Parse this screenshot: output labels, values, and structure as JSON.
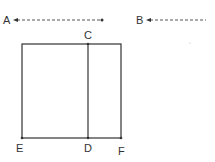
{
  "diagram": {
    "type": "geometry-figure",
    "colors": {
      "stroke": "#333333",
      "dashed": "#555555",
      "background": "#ffffff"
    },
    "arrows": [
      {
        "id": "A",
        "label": "A",
        "style": "dashed",
        "direction": "left",
        "x1": 14,
        "x2": 103,
        "y": 20,
        "label_x": 3,
        "label_y": 24
      },
      {
        "id": "B",
        "label": "B",
        "style": "dashed",
        "direction": "left",
        "x1": 147,
        "x2": 206,
        "y": 20,
        "label_x": 136,
        "label_y": 24
      }
    ],
    "rectangle": {
      "x": 22,
      "y": 44,
      "width": 99,
      "height": 94
    },
    "segment_CD": {
      "x": 88,
      "y1": 44,
      "y2": 138
    },
    "points": [
      {
        "id": "C",
        "label": "C",
        "x": 88,
        "y": 44,
        "label_x": 84,
        "label_y": 39
      },
      {
        "id": "E",
        "label": "E",
        "x": 22,
        "y": 138,
        "label_x": 16,
        "label_y": 152
      },
      {
        "id": "D",
        "label": "D",
        "x": 88,
        "y": 138,
        "label_x": 84,
        "label_y": 152
      },
      {
        "id": "F",
        "label": "F",
        "x": 121,
        "y": 138,
        "label_x": 118,
        "label_y": 155
      }
    ]
  }
}
